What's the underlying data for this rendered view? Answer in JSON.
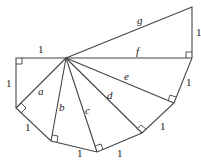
{
  "diagram": {
    "legs": [
      "1",
      "1",
      "1",
      "1",
      "1",
      "1",
      "1",
      "1"
    ],
    "hypotenuse_labels": [
      "a",
      "b",
      "c",
      "d",
      "e",
      "f",
      "g"
    ],
    "labels": {
      "top_leg": "1",
      "left_leg": "1",
      "leg_b1_b2": "1",
      "leg_b2_b3": "1",
      "leg_b3_b4": "1",
      "leg_b4_b5": "1",
      "leg_b5_b6": "1",
      "leg_b6_b7": "1",
      "a": "a",
      "b": "b",
      "c": "c",
      "d": "d",
      "e": "e",
      "f": "f",
      "g": "g"
    }
  }
}
